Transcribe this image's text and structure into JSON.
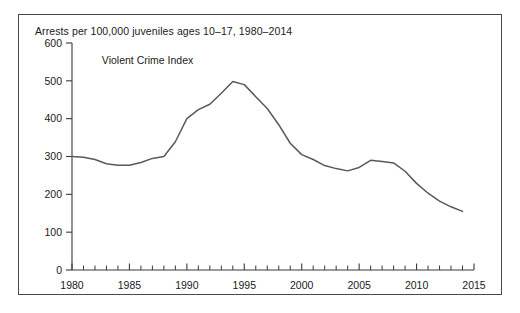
{
  "chart_data": {
    "type": "line",
    "title": "Arrests per 100,000 juveniles ages 10–17, 1980–2014",
    "xlabel": "",
    "ylabel": "",
    "xlim": [
      1980,
      2015
    ],
    "ylim": [
      0,
      600
    ],
    "grid": false,
    "legend_position": "inside-plot-upper-left",
    "y_ticks": [
      0,
      100,
      200,
      300,
      400,
      500,
      600
    ],
    "y_tick_labels": [
      "0",
      "100",
      "200",
      "300",
      "400",
      "500",
      "600"
    ],
    "x_ticks": [
      1980,
      1985,
      1990,
      1995,
      2000,
      2005,
      2010,
      2015
    ],
    "x_tick_labels": [
      "1980",
      "1985",
      "1990",
      "1995",
      "2000",
      "2005",
      "2010",
      "2015"
    ],
    "x_minor_tick_interval": 1,
    "line_color": "#595959",
    "series": [
      {
        "name": "Violent Crime Index",
        "x": [
          1980,
          1981,
          1982,
          1983,
          1984,
          1985,
          1986,
          1987,
          1988,
          1989,
          1990,
          1991,
          1992,
          1993,
          1994,
          1995,
          1996,
          1997,
          1998,
          1999,
          2000,
          2001,
          2002,
          2003,
          2004,
          2005,
          2006,
          2007,
          2008,
          2009,
          2010,
          2011,
          2012,
          2013,
          2014
        ],
        "values": [
          300,
          298,
          292,
          281,
          277,
          277,
          284,
          295,
          300,
          339,
          400,
          424,
          438,
          467,
          498,
          490,
          458,
          427,
          384,
          335,
          305,
          292,
          276,
          268,
          262,
          271,
          290,
          287,
          283,
          261,
          229,
          203,
          182,
          167,
          155
        ]
      }
    ],
    "annotations": [
      {
        "text": "Violent Crime Index",
        "x": 1982.6,
        "y": 545
      }
    ]
  }
}
